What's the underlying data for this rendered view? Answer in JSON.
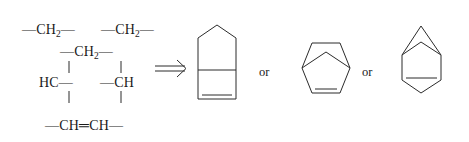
{
  "figure": {
    "type": "chemical-retrosynthesis-diagram",
    "background_color": "#ffffff",
    "line_color": "#2b2b2b",
    "text_color": "#1a1a1a"
  },
  "fragments": {
    "ch2_top_left": {
      "prefix": "—CH",
      "sub": "2",
      "suffix": "—"
    },
    "ch2_top_right": {
      "prefix": "—CH",
      "sub": "2",
      "suffix": "—"
    },
    "ch2_middle": {
      "prefix": "—CH",
      "sub": "2",
      "suffix": "—"
    },
    "hc_left": "HC—",
    "ch_right": "—CH",
    "chch_bottom": "—CH═CH—"
  },
  "arrow": {
    "symbol": "⟹",
    "label": "double-line retrosynthesis arrow"
  },
  "connectors": {
    "or_first": "or",
    "or_second": "or"
  },
  "structures": [
    {
      "name": "bicyclo[3.2.0]hept-6-ene",
      "description": "cyclopentane ring fused to a cyclobutene ring, double bond on bottom edge of the four-membered ring",
      "rings": [
        "cyclopentane",
        "cyclobutene"
      ],
      "double_bond_position": "bottom edge of four-membered ring"
    },
    {
      "name": "bicyclo[2.2.1]hept-2-ene",
      "description": "norbornene drawn as a hexagon outline with a one-carbon bridge, double bond on bottom edge",
      "rings": [
        "six-membered ring",
        "one-carbon bridge"
      ],
      "double_bond_position": "bottom edge"
    },
    {
      "name": "bicyclo[4.1.0]hept-3-ene",
      "description": "cyclohexene ring fused to a cyclopropane ring at the top, double bond on bottom edge",
      "rings": [
        "cyclohexene",
        "cyclopropane"
      ],
      "double_bond_position": "bottom edge of six-membered ring"
    }
  ]
}
